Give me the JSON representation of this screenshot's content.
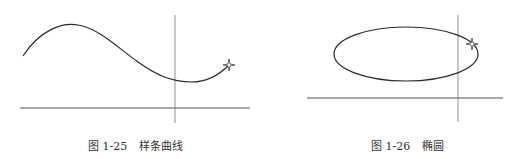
{
  "figures": [
    {
      "id": "fig-1-25",
      "caption": {
        "number": "图 1-25",
        "title": "样条曲线"
      },
      "shape": "spline",
      "marker": "star"
    },
    {
      "id": "fig-1-26",
      "caption": {
        "number": "图 1-26",
        "title": "椭圆"
      },
      "shape": "ellipse",
      "marker": "star"
    }
  ],
  "colors": {
    "stroke": "#2a2a2a",
    "axis": "#555555",
    "text": "#333333"
  }
}
